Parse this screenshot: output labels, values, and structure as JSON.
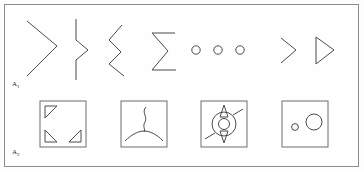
{
  "figure": {
    "background_color": "#fdfdfc",
    "frame_color": "#8d8d8d",
    "ink_color": "#4a4a4a",
    "width": 364,
    "height": 172
  },
  "rows": [
    {
      "id": "row-a1",
      "label": "A",
      "label_subscript": "1",
      "label_full": "A1",
      "shapes": [
        {
          "id": "chevron-right-large",
          "name": "large-right-chevron",
          "description": "large open chevron pointing right"
        },
        {
          "id": "vertical-zigzag-line",
          "name": "vertical-line-with-chevron-kink",
          "description": "vertical line with a rightward chevron kink at its middle"
        },
        {
          "id": "double-zigzag-left",
          "name": "double-left-zigzag",
          "description": "zigzag of two stacked leftward chevrons"
        },
        {
          "id": "sigma-shape",
          "name": "sigma-glyph",
          "description": "sigma shaped polyline with horizontal top and bottom bars"
        },
        {
          "id": "three-circles",
          "name": "three-small-circles-row",
          "description": "row of three small open circles",
          "count": 3
        },
        {
          "id": "chevron-right-small",
          "name": "small-right-chevron",
          "description": "small open chevron pointing right"
        },
        {
          "id": "triangle-right",
          "name": "right-pointing-triangle",
          "description": "closed triangle pointing right"
        }
      ]
    },
    {
      "id": "row-a2",
      "label": "A",
      "label_subscript": "2",
      "label_full": "A2",
      "shapes": [
        {
          "id": "box-corner-triangles",
          "name": "square-with-three-corner-triangles",
          "description": "square frame containing three small right triangles at the top-left, bottom-left and bottom-right corners",
          "triangle_count": 3
        },
        {
          "id": "box-wavy-arc",
          "name": "square-with-wavy-stem-and-arc",
          "description": "square frame containing a wavy vertical stem meeting a wide shallow arc"
        },
        {
          "id": "box-spiked-ring",
          "name": "square-with-spiked-concentric-circles",
          "description": "square frame containing concentric circles with two pointed spikes and two diagonal rays"
        },
        {
          "id": "box-two-circles",
          "name": "square-with-two-circles",
          "description": "square frame containing one small circle at the left and one larger circle at the right"
        }
      ]
    }
  ]
}
